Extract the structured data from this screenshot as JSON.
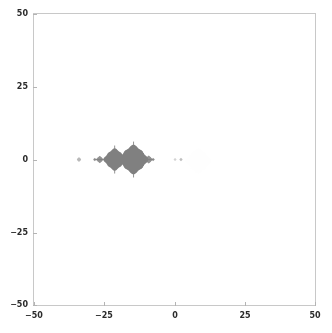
{
  "figure": {
    "background_color": "#ffffff",
    "width": 332,
    "height": 333
  },
  "axes": {
    "frame_color": "#c8c8c8",
    "tick_color": "#b4b4b4",
    "label_color": "#2b2b2b",
    "left": 33,
    "top": 13,
    "width": 283,
    "height": 293
  },
  "chart_data": {
    "type": "scatter",
    "title": "",
    "xlabel": "",
    "ylabel": "",
    "xlim": [
      -50,
      50
    ],
    "ylim": [
      -50,
      50
    ],
    "grid": false,
    "legend": null,
    "xticks": [
      -50,
      -25,
      0,
      25,
      50
    ],
    "xticklabels": [
      "−50",
      "−25",
      "0",
      "25",
      "50"
    ],
    "yticks": [
      -50,
      -25,
      0,
      25,
      50
    ],
    "yticklabels": [
      "−50",
      "−25",
      "0",
      "25",
      "50"
    ],
    "marker_color": "#808080",
    "faint_marker_color": "#f2f2f2",
    "features": [
      {
        "name": "left-satellite-dot",
        "x": -34,
        "y": 0,
        "radius_units": 0.7,
        "opacity": 0.55
      },
      {
        "name": "left-bulb-tail-dot",
        "x": -28.4,
        "y": 0,
        "radius_units": 0.5,
        "opacity": 0.7
      },
      {
        "name": "left-small-bulb",
        "x": -26.6,
        "y": 0,
        "radius_units": 1.1,
        "opacity": 0.85
      },
      {
        "name": "left-main-bulb",
        "x": -21.3,
        "y": 0,
        "radius_units": 3.5,
        "opacity": 1.0
      },
      {
        "name": "right-main-bulb",
        "x": -14.6,
        "y": 0,
        "radius_units": 4.6,
        "opacity": 1.0
      },
      {
        "name": "right-small-bulb",
        "x": -9.2,
        "y": 0,
        "radius_units": 1.2,
        "opacity": 0.85
      },
      {
        "name": "right-tail-dot",
        "x": -7.6,
        "y": 0,
        "radius_units": 0.5,
        "opacity": 0.7
      },
      {
        "name": "far-right-dot-a",
        "x": 0.2,
        "y": 0,
        "radius_units": 0.45,
        "opacity": 0.35
      },
      {
        "name": "far-right-dot-b",
        "x": 2.3,
        "y": 0,
        "radius_units": 0.5,
        "opacity": 0.5
      },
      {
        "name": "faint-halo",
        "x": 8.5,
        "y": -0.5,
        "radius_units": 4.0,
        "opacity": 0.06
      }
    ],
    "spikes": [
      {
        "x": -21.3,
        "y": 0,
        "half_length_units": 5.0,
        "orientation": "vertical",
        "opacity": 0.95
      },
      {
        "x": -14.6,
        "y": 0,
        "half_length_units": 6.4,
        "orientation": "vertical",
        "opacity": 0.95
      },
      {
        "x": -17.9,
        "y": 0,
        "half_length_units": 2.2,
        "orientation": "vertical",
        "opacity": 0.9
      }
    ]
  }
}
